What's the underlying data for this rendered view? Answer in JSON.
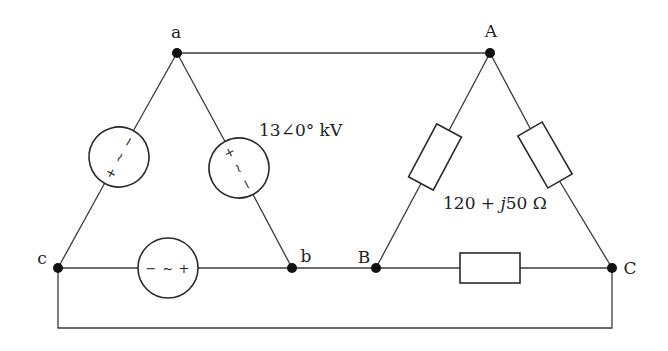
{
  "diagram": {
    "type": "three-phase delta-delta circuit",
    "source_side": {
      "nodes": [
        {
          "id": "a",
          "label": "a",
          "x": 177,
          "y": 53
        },
        {
          "id": "b",
          "label": "b",
          "x": 292,
          "y": 268
        },
        {
          "id": "c",
          "label": "c",
          "x": 58,
          "y": 268
        }
      ],
      "sources": [
        {
          "branch": "a-c",
          "symbols": [
            "−",
            "~",
            "+"
          ]
        },
        {
          "branch": "a-b",
          "symbols": [
            "+",
            "~",
            "−"
          ]
        },
        {
          "branch": "c-b",
          "symbols": [
            "−",
            "~",
            "+"
          ]
        }
      ],
      "voltage_label": "13∠0° kV"
    },
    "load_side": {
      "nodes": [
        {
          "id": "A",
          "label": "A",
          "x": 490,
          "y": 53
        },
        {
          "id": "B",
          "label": "B",
          "x": 376,
          "y": 268
        },
        {
          "id": "C",
          "label": "C",
          "x": 612,
          "y": 268
        }
      ],
      "impedances": [
        {
          "branch": "A-B"
        },
        {
          "branch": "A-C"
        },
        {
          "branch": "B-C"
        }
      ],
      "impedance_label": "120 + j50 Ω",
      "impedance_parts": {
        "real": "120 + ",
        "j": "j",
        "imag": "50 Ω"
      }
    },
    "connections": [
      {
        "from": "a",
        "to": "A"
      },
      {
        "from": "b",
        "to": "B"
      },
      {
        "from": "c",
        "to": "C"
      }
    ]
  }
}
